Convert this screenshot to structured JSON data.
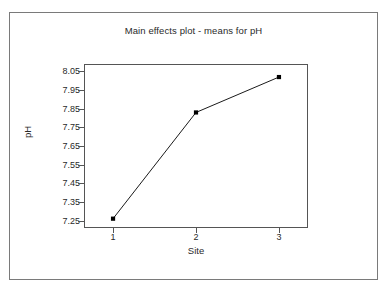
{
  "figure": {
    "title": "Main effects plot - means for pH",
    "background_color": "#ffffff",
    "border_color": "#7a7a7a",
    "axis_color": "#555555",
    "series_color": "#000000"
  },
  "chart_data": {
    "type": "line",
    "title": "Main effects plot - means for pH",
    "xlabel": "Site",
    "ylabel": "pH",
    "x": [
      1,
      2,
      3
    ],
    "categories": [
      "1",
      "2",
      "3"
    ],
    "values": [
      7.26,
      7.83,
      8.02
    ],
    "series": [
      {
        "name": "means for pH",
        "values": [
          7.26,
          7.83,
          8.02
        ]
      }
    ],
    "xlim": [
      0.65,
      3.35
    ],
    "ylim": [
      7.21,
      8.09
    ],
    "xticks": [
      1,
      2,
      3
    ],
    "xtick_labels": [
      "1",
      "2",
      "3"
    ],
    "yticks": [
      7.25,
      7.35,
      7.45,
      7.55,
      7.65,
      7.75,
      7.85,
      7.95,
      8.05
    ],
    "ytick_labels": [
      "8.05",
      "7.95",
      "7.85",
      "7.75",
      "7.65",
      "7.55",
      "7.45",
      "7.35",
      "7.25"
    ],
    "grid": false,
    "legend": false,
    "legend_position": "none",
    "marker": "filled-square",
    "line_style": "solid"
  }
}
